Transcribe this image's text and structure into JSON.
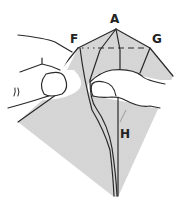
{
  "diagram": {
    "type": "origami-folding-step",
    "labels": {
      "apex": "A",
      "left_point": "F",
      "right_point": "G",
      "center_crease": "H"
    },
    "colors": {
      "paper": "#d9d9d9",
      "line": "#2a2a2a",
      "hand": "#ffffff",
      "background": "#ffffff"
    },
    "elements": [
      "paper-kite",
      "left-hand-pinching",
      "right-thumb-pressing",
      "fold-line-F-G-dashed",
      "center-crease"
    ]
  }
}
